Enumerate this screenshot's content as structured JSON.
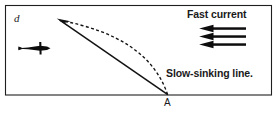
{
  "figure": {
    "caption_labels": {
      "depth_label": "d",
      "point_label": "A",
      "current_label": "Fast current",
      "line_label": "Slow-sinking line."
    },
    "frame": {
      "border_color": "#1f1f1f",
      "background": "#ffffff",
      "left": 5,
      "top": 5,
      "right": 272,
      "bottom": 95
    },
    "icons": {
      "fish": "fish-right-icon",
      "current_arrow": "arrow-left-icon",
      "line_arrow": "arrow-up-left-icon"
    },
    "elements": {
      "straight_line": {
        "name": "slow-sinking-line-straight",
        "from": [
          168,
          95
        ],
        "to": [
          58,
          20
        ],
        "style": "solid",
        "color": "#121212",
        "width": 1.4
      },
      "curved_line": {
        "name": "slow-sinking-line-curved",
        "from": [
          168,
          95
        ],
        "to": [
          58,
          20
        ],
        "control": [
          148,
          36
        ],
        "style": "dashed",
        "color": "#121212",
        "width": 1.3,
        "dash": "3,2.4"
      },
      "current_arrows": {
        "name": "fast-current-arrows",
        "count": 3,
        "direction": "left",
        "x_start": 246,
        "x_end": 199,
        "y_positions": [
          28.5,
          36.5,
          44.5
        ],
        "color": "#0d0d0d"
      },
      "fish": {
        "name": "fish-marker",
        "x": 18,
        "y": 48,
        "length": 32,
        "direction": "right",
        "color": "#0d0d0d"
      }
    }
  }
}
